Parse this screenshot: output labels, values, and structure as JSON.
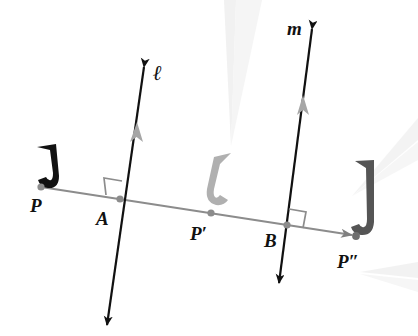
{
  "figure": {
    "type": "geometry-diagram",
    "background_color": "#ffffff",
    "labels": {
      "point_p": "P",
      "point_a": "A",
      "point_p_prime": "P′",
      "point_b": "B",
      "point_p_double_prime": "P″",
      "line_l": "ℓ",
      "line_m": "m"
    },
    "colors": {
      "baseline": "#8c8c8c",
      "line_l": "#111111",
      "line_m": "#111111",
      "shape_original": "#111111",
      "shape_image_first": "#b0b0b0",
      "shape_image_second": "#555555",
      "point_dot": "#8c8c8c",
      "right_angle": "#8c8c8c",
      "label_text": "#111111",
      "artifact": "#e2e2e2"
    },
    "points": {
      "P": {
        "x": 41,
        "y": 187
      },
      "A": {
        "x": 120,
        "y": 199
      },
      "P_prime": {
        "x": 211,
        "y": 213
      },
      "B": {
        "x": 287,
        "y": 225
      },
      "P_double_prime": {
        "x": 356,
        "y": 236
      }
    },
    "lines": {
      "baseline": {
        "from": {
          "x": 41,
          "y": 187
        },
        "to": {
          "x": 360,
          "y": 236
        },
        "arrow_end": true
      },
      "l": {
        "top": {
          "x": 146,
          "y": 60
        },
        "bottom": {
          "x": 105,
          "y": 332
        },
        "arrow_both": true,
        "mid_mark": 1
      },
      "m": {
        "top": {
          "x": 314,
          "y": 22
        },
        "bottom": {
          "x": 277,
          "y": 290
        },
        "arrow_both": true,
        "mid_mark": 1
      }
    },
    "right_angles": [
      {
        "at": "A",
        "position": "upper-left"
      },
      {
        "at": "B",
        "position": "upper-right"
      }
    ],
    "shapes": [
      {
        "name": "original-J",
        "at": "P",
        "fill": "#111111",
        "flipped": false
      },
      {
        "name": "reflected-J",
        "at": "P′",
        "fill": "#b0b0b0",
        "flipped": true
      },
      {
        "name": "double-reflected-J",
        "at": "P″",
        "fill": "#555555",
        "flipped": false
      }
    ]
  }
}
